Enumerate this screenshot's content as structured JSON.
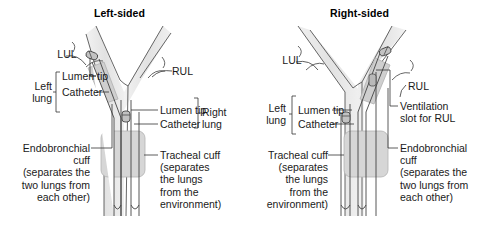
{
  "figure": {
    "type": "medical-diagram",
    "panels": [
      {
        "id": "left-sided",
        "title": "Left-sided",
        "labels": {
          "lul": "LUL",
          "rul": "RUL",
          "left_lung": "Left\nlung",
          "right_lung": "Right\nlung",
          "left_lumen_tip": "Lumen tip",
          "left_catheter": "Catheter",
          "right_lumen_tip": "Lumen tip",
          "right_catheter": "Catheter",
          "endobronchial_cuff": "Endobronchial\ncuff\n(separates the\ntwo lungs from\neach other)",
          "tracheal_cuff": "Tracheal cuff\n(separates\nthe lungs\nfrom the\nenvironment)"
        }
      },
      {
        "id": "right-sided",
        "title": "Right-sided",
        "labels": {
          "lul": "LUL",
          "rul": "RUL",
          "left_lung": "Left\nlung",
          "left_lumen_tip": "Lumen tip",
          "left_catheter": "Catheter",
          "ventilation_slot": "Ventilation\nslot for RUL",
          "tracheal_cuff": "Tracheal cuff\n(separates\nthe lungs\nfrom the\nenvironment)",
          "endobronchial_cuff": "Endobronchial\ncuff\n(separates the\ntwo lungs from\neach other)"
        }
      }
    ],
    "colors": {
      "background": "#ffffff",
      "text": "#1a1a1a",
      "stroke": "#4a4a4a",
      "airway_fill": "#e6e6e6",
      "cuff_fill": "#d3d3d3",
      "tube_fill": "#ffffff",
      "tip_fill": "#bdbdbd"
    }
  }
}
